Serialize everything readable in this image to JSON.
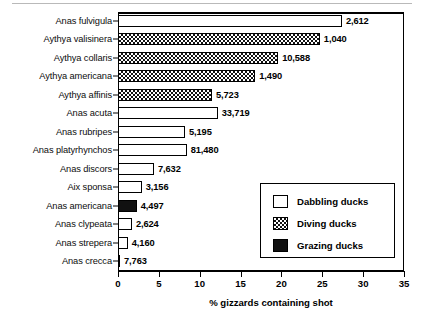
{
  "chart_data": {
    "type": "bar",
    "orientation": "horizontal",
    "title": "",
    "xlabel": "% gizzards containing shot",
    "ylabel": "",
    "xlim": [
      0,
      35
    ],
    "xticks": [
      0,
      5,
      10,
      15,
      20,
      25,
      30,
      35
    ],
    "grid": false,
    "legend_position": "inside-lower-right",
    "categories": [
      "Anas fulvigula",
      "Aythya valisinera",
      "Aythya collaris",
      "Aythya americana",
      "Aythya affinis",
      "Anas acuta",
      "Anas rubripes",
      "Anas platyrhynchos",
      "Anas discors",
      "Aix sponsa",
      "Anas americana",
      "Anas clypeata",
      "Anas strepera",
      "Anas crecca"
    ],
    "values": [
      27.4,
      24.7,
      19.6,
      16.8,
      11.5,
      12.2,
      8.2,
      8.4,
      4.4,
      2.9,
      2.3,
      1.7,
      1.2,
      0.25
    ],
    "point_labels": [
      "2,612",
      "1,040",
      "10,588",
      "1,490",
      "5,723",
      "33,719",
      "5,195",
      "81,480",
      "7,632",
      "3,156",
      "4,497",
      "2,624",
      "4,160",
      "7,763"
    ],
    "groups": [
      "dabbling",
      "diving",
      "diving",
      "diving",
      "diving",
      "dabbling",
      "dabbling",
      "dabbling",
      "dabbling",
      "dabbling",
      "grazing",
      "dabbling",
      "dabbling",
      "dabbling"
    ],
    "legend": [
      {
        "key": "dabbling",
        "label": "Dabbling ducks"
      },
      {
        "key": "diving",
        "label": "Diving ducks"
      },
      {
        "key": "grazing",
        "label": "Grazing ducks"
      }
    ],
    "colors": {
      "dabbling": "#ffffff",
      "diving": "#ffffff",
      "grazing": "#111111",
      "outline": "#000000"
    }
  }
}
